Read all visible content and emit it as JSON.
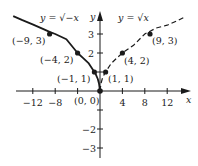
{
  "diagram": {
    "colors": {
      "ink": "#1a1a1a",
      "background": "#ffffff"
    },
    "axes": {
      "x_label": "x",
      "y_label": "y",
      "x_ticks": [
        {
          "value": -12,
          "label": "−12"
        },
        {
          "value": -8,
          "label": "−8"
        },
        {
          "value": -4,
          "label": ""
        },
        {
          "value": 4,
          "label": "4"
        },
        {
          "value": 8,
          "label": "8"
        },
        {
          "value": 12,
          "label": "12"
        }
      ],
      "y_ticks": [
        {
          "value": 3,
          "label": "3"
        },
        {
          "value": 2,
          "label": "2"
        },
        {
          "value": 1,
          "label": ""
        },
        {
          "value": -1,
          "label": ""
        },
        {
          "value": -2,
          "label": "−2"
        },
        {
          "value": -3,
          "label": "−3"
        }
      ]
    },
    "curves": [
      {
        "name": "y = sqrt(-x)",
        "label": "y = √−x",
        "style": "solid"
      },
      {
        "name": "y = sqrt(x)",
        "label": "y = √x",
        "style": "dashed"
      }
    ],
    "points": [
      {
        "x": -9,
        "y": 3,
        "label": "(−9, 3)"
      },
      {
        "x": -4,
        "y": 2,
        "label": "(−4, 2)"
      },
      {
        "x": -1,
        "y": 1,
        "label": "(−1, 1)"
      },
      {
        "x": 0,
        "y": 0,
        "label": "(0, 0)"
      },
      {
        "x": 1,
        "y": 1,
        "label": "(1, 1)"
      },
      {
        "x": 4,
        "y": 2,
        "label": "(4, 2)"
      },
      {
        "x": 9,
        "y": 3,
        "label": "(9, 3)"
      }
    ]
  }
}
